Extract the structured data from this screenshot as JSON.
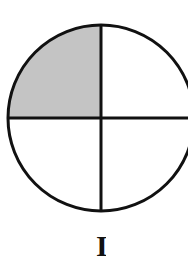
{
  "diagram": {
    "type": "fraction-circle",
    "parts": 4,
    "shaded_parts": 1,
    "shaded_quadrant": "top-left",
    "colors": {
      "outline": "#111111",
      "shaded": "#c4c4c4",
      "background": "#ffffff"
    },
    "label": "I"
  }
}
